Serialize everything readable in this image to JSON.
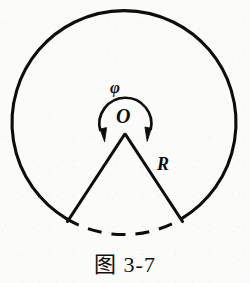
{
  "figure": {
    "caption": "图 3-7",
    "labels": {
      "angle_symbol": "φ",
      "center_point": "O",
      "radius_symbol": "R"
    },
    "colors": {
      "ink": "#0d0d0d",
      "paper": "#fbfbf9"
    },
    "geometry": {
      "circle": {
        "center_x": 124,
        "center_y": 123,
        "radius": 112,
        "stroke_width": 3,
        "style": "solid"
      },
      "apex": {
        "x": 125,
        "y": 136
      },
      "radius_left_endpoint": {
        "x": 66,
        "y": 224
      },
      "radius_right_endpoint": {
        "x": 184,
        "y": 224
      },
      "dashed_arc": {
        "description": "dashed circular arc spanning the base between the two radii endpoints",
        "style": "dashed",
        "dash_pattern": "13 9"
      },
      "angle_arc": {
        "description": "double-headed arc around the apex indicating the angle phi",
        "center_x": 125,
        "center_y": 121,
        "radius": 26,
        "start_angle_deg": 200,
        "end_angle_deg": -20,
        "arrowheads": "both-ends"
      }
    }
  }
}
